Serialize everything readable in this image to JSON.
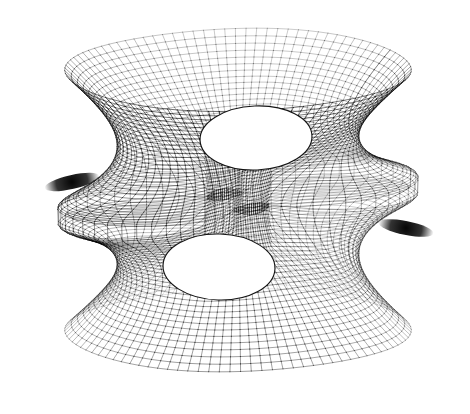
{
  "figure": {
    "render_style": "wireframe-mesh",
    "background_color": "#ffffff",
    "line_color": "#000000",
    "caption": "Wireframe rendering of a genus-one triply-punctured minimal surface (Costa surface) showing an upper flared catenoid annulus, a lower flared catenoid annulus, and two opposing horizontal planar-end lobes with dark self-folding slits at left and right.",
    "canvas": {
      "width": 470,
      "height": 414
    },
    "bounds": {
      "left": 22,
      "right": 455,
      "top": 15,
      "bottom": 386
    },
    "features": [
      {
        "name": "upper-annulus-rim",
        "label": "Upper flared catenoid rim",
        "center_x": 238,
        "center_y": 62,
        "radius_x": 168,
        "radius_y": 54
      },
      {
        "name": "upper-hole",
        "label": "Upper throat opening",
        "center_x": 256,
        "center_y": 138,
        "radius_x": 56,
        "radius_y": 32
      },
      {
        "name": "lower-hole",
        "label": "Lower throat opening",
        "center_x": 219,
        "center_y": 267,
        "radius_x": 56,
        "radius_y": 33
      },
      {
        "name": "lower-annulus-rim",
        "label": "Lower flared catenoid rim",
        "center_x": 228,
        "center_y": 330,
        "radius_x": 160,
        "radius_y": 56
      },
      {
        "name": "left-lobe-slit",
        "label": "Left planar-end fold slit",
        "center_x": 72,
        "center_y": 182,
        "radius_x": 28,
        "radius_y": 7
      },
      {
        "name": "right-lobe-slit",
        "label": "Right planar-end fold slit",
        "center_x": 406,
        "center_y": 228,
        "radius_x": 28,
        "radius_y": 7
      }
    ]
  },
  "chart_data": {
    "type": "surface-wireframe",
    "xlabel": "",
    "ylabel": "",
    "grid": true,
    "legend_position": "none",
    "mesh": {
      "u_lines": 96,
      "v_lines": 64,
      "u_range": [
        0,
        6.283185307179586
      ],
      "v_range": [
        -1.0,
        1.0
      ],
      "line_width": 0.45,
      "line_color": "#000000"
    },
    "projection": {
      "type": "orthographic",
      "azimuth_deg": 28,
      "elevation_deg": 24,
      "scale": 95,
      "origin_x": 238,
      "origin_y": 200
    },
    "annotations": [
      "upper catenoid end",
      "lower catenoid end",
      "left planar end",
      "right planar end"
    ]
  }
}
